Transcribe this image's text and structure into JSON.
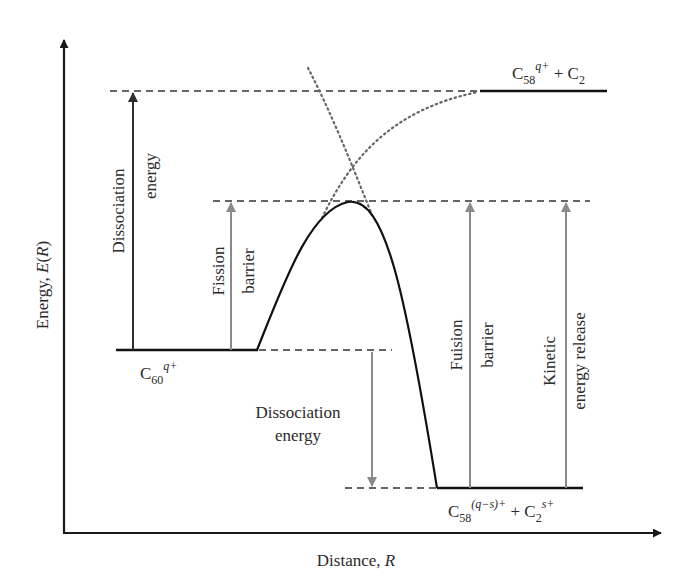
{
  "figure": {
    "type": "potential-energy-diagram",
    "axes": {
      "y_label_prefix": "Energy, ",
      "y_label_var": "E",
      "y_label_paren_open": "(",
      "y_label_paren_var": "R",
      "y_label_paren_close": ")",
      "x_label_prefix": "Distance, ",
      "x_label_var": "R"
    },
    "states": {
      "reactant": {
        "base": "C",
        "sub": "60",
        "sup": "q+"
      },
      "neutral_products": {
        "a_base": "C",
        "a_sub": "58",
        "a_sup": "q+",
        "plus": " + ",
        "b_base": "C",
        "b_sub": "2"
      },
      "charged_products": {
        "a_base": "C",
        "a_sub": "58",
        "a_sup": "(q−s)+",
        "plus": " + ",
        "b_base": "C",
        "b_sub": "2",
        "b_sup": "s+"
      }
    },
    "arrows": {
      "dissociation_left": {
        "line1": "Dissociation",
        "line2": "energy"
      },
      "fission_barrier": {
        "line1": "Fission",
        "line2": "barrier"
      },
      "dissociation_down": {
        "line1": "Dissociation",
        "line2": "energy"
      },
      "fusion_barrier": {
        "line1": "Fuision",
        "line2": "barrier"
      },
      "kinetic_release": {
        "line1": "Kinetic",
        "line2": "energy release"
      }
    },
    "colors": {
      "axis": "#1a1a1a",
      "curve": "#111111",
      "dashed": "#333333",
      "dotted": "#666666",
      "dark_arrow": "#2e2e2e",
      "gray_arrow": "#8a8a8a",
      "text": "#2b2b2b"
    }
  }
}
